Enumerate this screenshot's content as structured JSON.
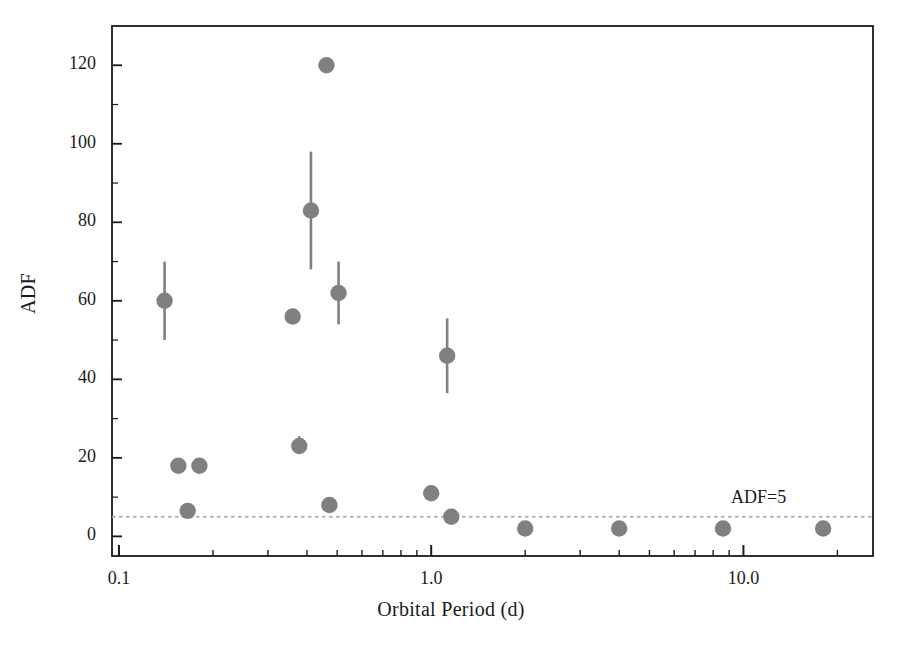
{
  "chart_data": {
    "type": "scatter",
    "title": "",
    "xlabel": "Orbital Period (d)",
    "ylabel": "ADF",
    "xscale": "log",
    "yscale": "linear",
    "xlim": [
      0.095,
      26.0
    ],
    "ylim": [
      -5,
      130
    ],
    "grid": false,
    "legend": null,
    "xticks": [
      0.1,
      1.0,
      10.0
    ],
    "xtick_labels": [
      "0.1",
      "1.0",
      "10.0"
    ],
    "yticks": [
      0,
      20,
      40,
      60,
      80,
      100,
      120
    ],
    "ytick_labels": [
      "0",
      "20",
      "40",
      "60",
      "80",
      "100",
      "120"
    ],
    "marker_color": "#808080",
    "errorbar_color": "#808080",
    "refline_color": "#b0b0b0",
    "points": [
      {
        "x": 0.14,
        "y": 60,
        "yerr_low": 50.0,
        "yerr_high": 70.0
      },
      {
        "x": 0.155,
        "y": 18,
        "yerr_low": null,
        "yerr_high": null
      },
      {
        "x": 0.166,
        "y": 6.5,
        "yerr_low": null,
        "yerr_high": null
      },
      {
        "x": 0.181,
        "y": 18,
        "yerr_low": null,
        "yerr_high": null
      },
      {
        "x": 0.36,
        "y": 56,
        "yerr_low": null,
        "yerr_high": null
      },
      {
        "x": 0.378,
        "y": 23,
        "yerr_low": 21.0,
        "yerr_high": 25.5
      },
      {
        "x": 0.412,
        "y": 83,
        "yerr_low": 68.0,
        "yerr_high": 98.0
      },
      {
        "x": 0.462,
        "y": 120,
        "yerr_low": null,
        "yerr_high": null
      },
      {
        "x": 0.472,
        "y": 8,
        "yerr_low": null,
        "yerr_high": null
      },
      {
        "x": 0.505,
        "y": 62,
        "yerr_low": 54.0,
        "yerr_high": 70.0
      },
      {
        "x": 1.0,
        "y": 11,
        "yerr_low": null,
        "yerr_high": null
      },
      {
        "x": 1.125,
        "y": 46,
        "yerr_low": 36.5,
        "yerr_high": 55.5
      },
      {
        "x": 1.16,
        "y": 5,
        "yerr_low": null,
        "yerr_high": null
      },
      {
        "x": 2.0,
        "y": 2,
        "yerr_low": null,
        "yerr_high": null
      },
      {
        "x": 4.0,
        "y": 2,
        "yerr_low": null,
        "yerr_high": null
      },
      {
        "x": 8.6,
        "y": 2,
        "yerr_low": null,
        "yerr_high": null
      },
      {
        "x": 18.0,
        "y": 2,
        "yerr_low": null,
        "yerr_high": null
      }
    ],
    "reference_lines": [
      {
        "orientation": "horizontal",
        "y": 5,
        "style": "dotted",
        "label": "ADF=5"
      }
    ],
    "annotations": [
      {
        "text": "ADF=5",
        "x": 13.0,
        "y": 9.5
      }
    ]
  }
}
